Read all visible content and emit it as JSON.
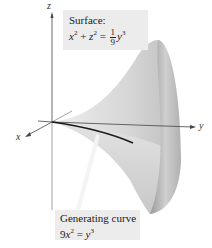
{
  "figure": {
    "type": "3d-surface-of-revolution",
    "axes": {
      "z_label": "z",
      "x_label": "x",
      "y_label": "y"
    },
    "surface_label": {
      "title": "Surface:",
      "equation_lhs_x": "x",
      "equation_lhs_z": "z",
      "exp2": "2",
      "plus": "+",
      "equals": "=",
      "frac_num": "1",
      "frac_den": "9",
      "rhs_var": "y",
      "exp3": "3"
    },
    "curve_label": {
      "title": "Generating curve",
      "coef": "9",
      "var_x": "x",
      "exp2": "2",
      "equals": "=",
      "rhs_var": "y",
      "exp3": "3"
    },
    "colors": {
      "surface_light": "#e6e6e6",
      "surface_mid": "#c4c4c4",
      "surface_dark": "#8a8a8a",
      "curve": "#1a1a1a",
      "axis": "#444444",
      "label_bg": "#ececec"
    }
  }
}
